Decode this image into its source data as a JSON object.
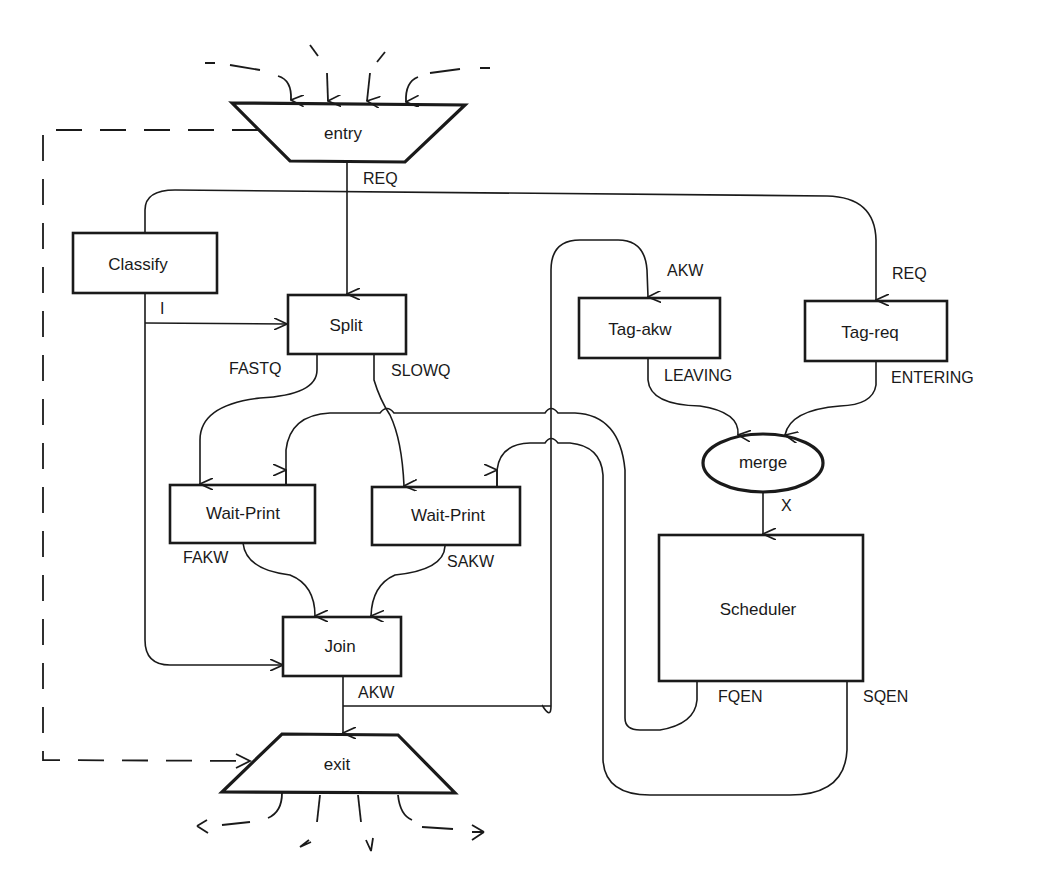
{
  "diagram": {
    "type": "dataflow",
    "nodes": {
      "entry": {
        "label": "entry",
        "shape": "inverted-trapezoid"
      },
      "exit": {
        "label": "exit",
        "shape": "trapezoid"
      },
      "classify": {
        "label": "Classify",
        "shape": "box"
      },
      "split": {
        "label": "Split",
        "shape": "box"
      },
      "wait_print_fast": {
        "label": "Wait-Print",
        "shape": "box"
      },
      "wait_print_slow": {
        "label": "Wait-Print",
        "shape": "box"
      },
      "join": {
        "label": "Join",
        "shape": "box"
      },
      "tag_akw": {
        "label": "Tag-akw",
        "shape": "box"
      },
      "tag_req": {
        "label": "Tag-req",
        "shape": "box"
      },
      "merge": {
        "label": "merge",
        "shape": "ellipse"
      },
      "scheduler": {
        "label": "Scheduler",
        "shape": "box"
      }
    },
    "edges": {
      "entry_req": "REQ",
      "classify_i": "I",
      "split_fastq": "FASTQ",
      "split_slowq": "SLOWQ",
      "wait_fakw": "FAKW",
      "wait_sakw": "SAKW",
      "join_akw": "AKW",
      "tag_akw_in": "AKW",
      "tag_req_in": "REQ",
      "tag_akw_out": "LEAVING",
      "tag_req_out": "ENTERING",
      "merge_x": "X",
      "sched_fqen": "FQEN",
      "sched_sqen": "SQEN"
    },
    "colors": {
      "ink": "#1a1a1a",
      "background": "#ffffff"
    }
  }
}
